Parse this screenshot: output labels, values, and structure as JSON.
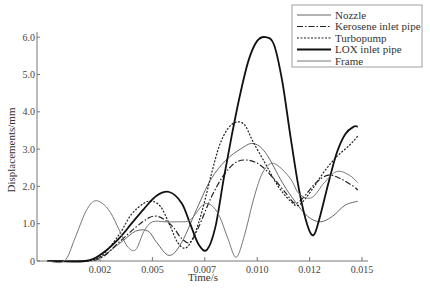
{
  "chart_data": {
    "type": "line",
    "title": "",
    "xlabel": "Time/s",
    "ylabel": "Displacements/mm",
    "xlim": [
      0,
      0.0148
    ],
    "ylim": [
      0,
      6.0
    ],
    "x_ticks": [
      {
        "value": 0.0025,
        "label": "0.002"
      },
      {
        "value": 0.005,
        "label": "0.005"
      },
      {
        "value": 0.0075,
        "label": "0.007"
      },
      {
        "value": 0.01,
        "label": "0.010"
      },
      {
        "value": 0.0125,
        "label": "0.012"
      },
      {
        "value": 0.015,
        "label": "0.015"
      }
    ],
    "y_ticks": [
      {
        "value": 0,
        "label": "0"
      },
      {
        "value": 1.0,
        "label": "1.0"
      },
      {
        "value": 2.0,
        "label": "2.0"
      },
      {
        "value": 3.0,
        "label": "3.0"
      },
      {
        "value": 4.0,
        "label": "4.0"
      },
      {
        "value": 5.0,
        "label": "5.0"
      },
      {
        "value": 6.0,
        "label": "6.0"
      }
    ],
    "grid": false,
    "legend_position": "upper right",
    "series": [
      {
        "name": "Nozzle",
        "style": "thin-solid-gray",
        "color": "#666666",
        "width": 1,
        "dash": "",
        "points": [
          [
            0,
            0
          ],
          [
            0.0015,
            0
          ],
          [
            0.0025,
            0.1
          ],
          [
            0.0035,
            0.5
          ],
          [
            0.0042,
            0.8
          ],
          [
            0.0048,
            0.8
          ],
          [
            0.0052,
            0.5
          ],
          [
            0.0058,
            0.15
          ],
          [
            0.0064,
            0.5
          ],
          [
            0.0072,
            1.5
          ],
          [
            0.0078,
            2.2
          ],
          [
            0.0085,
            2.7
          ],
          [
            0.0092,
            3.0
          ],
          [
            0.0098,
            3.15
          ],
          [
            0.0104,
            2.9
          ],
          [
            0.0112,
            2.1
          ],
          [
            0.0118,
            1.6
          ],
          [
            0.0124,
            1.2
          ],
          [
            0.013,
            1.05
          ],
          [
            0.0136,
            1.2
          ],
          [
            0.0142,
            1.5
          ],
          [
            0.0148,
            1.6
          ]
        ]
      },
      {
        "name": "Kerosene inlet pipe",
        "style": "dash-dot",
        "color": "#222222",
        "width": 1.2,
        "dash": "6,2,1.5,2",
        "points": [
          [
            0,
            0
          ],
          [
            0.0018,
            0
          ],
          [
            0.0026,
            0.1
          ],
          [
            0.0034,
            0.5
          ],
          [
            0.0042,
            0.9
          ],
          [
            0.0048,
            1.15
          ],
          [
            0.0052,
            1.2
          ],
          [
            0.0056,
            1.1
          ],
          [
            0.006,
            0.9
          ],
          [
            0.0064,
            0.6
          ],
          [
            0.0068,
            0.5
          ],
          [
            0.0072,
            0.9
          ],
          [
            0.0078,
            1.7
          ],
          [
            0.0084,
            2.3
          ],
          [
            0.009,
            2.65
          ],
          [
            0.0096,
            2.7
          ],
          [
            0.0102,
            2.55
          ],
          [
            0.0108,
            2.2
          ],
          [
            0.0114,
            1.8
          ],
          [
            0.0118,
            1.55
          ],
          [
            0.0122,
            1.7
          ],
          [
            0.0128,
            2.1
          ],
          [
            0.0134,
            2.3
          ],
          [
            0.014,
            2.2
          ],
          [
            0.0146,
            2.0
          ],
          [
            0.0148,
            1.9
          ]
        ]
      },
      {
        "name": "Turbopump",
        "style": "dotted",
        "color": "#222222",
        "width": 1.2,
        "dash": "2,1.5",
        "points": [
          [
            0,
            0
          ],
          [
            0.0018,
            0
          ],
          [
            0.0026,
            0.15
          ],
          [
            0.0034,
            0.7
          ],
          [
            0.004,
            1.25
          ],
          [
            0.0046,
            1.55
          ],
          [
            0.005,
            1.6
          ],
          [
            0.0054,
            1.45
          ],
          [
            0.0058,
            1.0
          ],
          [
            0.0062,
            0.5
          ],
          [
            0.0066,
            0.35
          ],
          [
            0.007,
            0.7
          ],
          [
            0.0074,
            1.4
          ],
          [
            0.0078,
            2.3
          ],
          [
            0.0082,
            3.1
          ],
          [
            0.0086,
            3.55
          ],
          [
            0.009,
            3.72
          ],
          [
            0.0094,
            3.65
          ],
          [
            0.0098,
            3.2
          ],
          [
            0.0104,
            2.6
          ],
          [
            0.011,
            2.0
          ],
          [
            0.0116,
            1.6
          ],
          [
            0.012,
            1.5
          ],
          [
            0.0126,
            1.9
          ],
          [
            0.0132,
            2.4
          ],
          [
            0.0138,
            2.8
          ],
          [
            0.0144,
            3.1
          ],
          [
            0.0148,
            3.35
          ]
        ]
      },
      {
        "name": "LOX inlet pipe",
        "style": "thick-solid-black",
        "color": "#111111",
        "width": 1.8,
        "dash": "",
        "points": [
          [
            0,
            0
          ],
          [
            0.0018,
            0
          ],
          [
            0.0026,
            0.2
          ],
          [
            0.0034,
            0.6
          ],
          [
            0.004,
            1.0
          ],
          [
            0.0046,
            1.4
          ],
          [
            0.0052,
            1.75
          ],
          [
            0.0058,
            1.85
          ],
          [
            0.0064,
            1.55
          ],
          [
            0.0068,
            1.0
          ],
          [
            0.0072,
            0.45
          ],
          [
            0.0076,
            0.3
          ],
          [
            0.008,
            0.9
          ],
          [
            0.0084,
            2.2
          ],
          [
            0.0088,
            3.4
          ],
          [
            0.0092,
            4.5
          ],
          [
            0.0096,
            5.4
          ],
          [
            0.01,
            5.9
          ],
          [
            0.0104,
            6.0
          ],
          [
            0.0108,
            5.8
          ],
          [
            0.0112,
            4.8
          ],
          [
            0.0116,
            3.3
          ],
          [
            0.012,
            1.9
          ],
          [
            0.0124,
            0.95
          ],
          [
            0.0127,
            0.7
          ],
          [
            0.013,
            1.2
          ],
          [
            0.0134,
            2.1
          ],
          [
            0.0138,
            2.9
          ],
          [
            0.0142,
            3.4
          ],
          [
            0.0146,
            3.6
          ],
          [
            0.0148,
            3.6
          ]
        ]
      },
      {
        "name": "Frame",
        "style": "thin-solid-gray",
        "color": "#777777",
        "width": 1,
        "dash": "",
        "points": [
          [
            0,
            0
          ],
          [
            0.0008,
            0
          ],
          [
            0.0013,
            0.6
          ],
          [
            0.0018,
            1.3
          ],
          [
            0.0022,
            1.6
          ],
          [
            0.0026,
            1.55
          ],
          [
            0.003,
            1.3
          ],
          [
            0.0034,
            0.85
          ],
          [
            0.0038,
            0.4
          ],
          [
            0.0042,
            0.3
          ],
          [
            0.0046,
            0.8
          ],
          [
            0.005,
            1.05
          ],
          [
            0.0056,
            1.05
          ],
          [
            0.0062,
            1.05
          ],
          [
            0.0068,
            1.1
          ],
          [
            0.0074,
            1.5
          ],
          [
            0.0078,
            1.5
          ],
          [
            0.0082,
            1.2
          ],
          [
            0.0086,
            0.6
          ],
          [
            0.009,
            0.1
          ],
          [
            0.0094,
            0.7
          ],
          [
            0.0098,
            1.6
          ],
          [
            0.0102,
            2.3
          ],
          [
            0.0106,
            2.6
          ],
          [
            0.011,
            2.55
          ],
          [
            0.0116,
            2.2
          ],
          [
            0.012,
            1.8
          ],
          [
            0.0126,
            1.7
          ],
          [
            0.0132,
            2.1
          ],
          [
            0.0138,
            2.4
          ],
          [
            0.0144,
            2.3
          ],
          [
            0.0148,
            2.1
          ]
        ]
      }
    ]
  },
  "legend": {
    "items": [
      {
        "label": "Nozzle",
        "series": 0
      },
      {
        "label": "Kerosene inlet pipe",
        "series": 1
      },
      {
        "label": "Turbopump",
        "series": 2
      },
      {
        "label": "LOX inlet pipe",
        "series": 3
      },
      {
        "label": "Frame",
        "series": 4
      }
    ]
  }
}
